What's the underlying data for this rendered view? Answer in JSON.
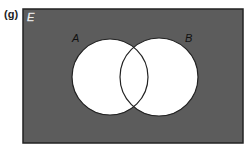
{
  "figure": {
    "part_label": "(g)",
    "universal_set_label": "E",
    "set_a_label": "A",
    "set_b_label": "B",
    "shaded_region": "complement of A union B",
    "colors": {
      "shade": "#5c5c5c",
      "set_fill": "#ffffff",
      "outline": "#222222",
      "universal_label": "#ffffff"
    }
  }
}
